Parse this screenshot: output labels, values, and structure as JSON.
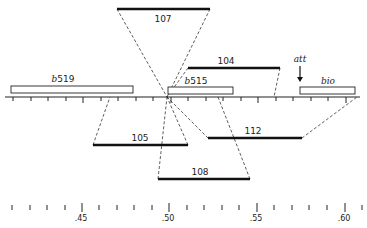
{
  "diagram": {
    "type": "genetic deletion/mapping diagram",
    "axis": {
      "y": 97,
      "x_start": 5,
      "x_end": 360,
      "tick_xs": [
        13,
        31,
        48,
        66,
        83,
        101,
        118,
        136,
        153,
        171,
        188,
        206,
        223,
        241,
        258,
        276,
        293,
        311,
        328,
        346
      ]
    },
    "pivot": {
      "x": 167,
      "y": 97
    },
    "segments": [
      {
        "id": "s107",
        "label": "107",
        "x1": 117,
        "x2": 210,
        "y": 9,
        "label_x": 163,
        "label_y": 22
      },
      {
        "id": "s104",
        "label": "104",
        "x1": 188,
        "x2": 280,
        "y": 68,
        "label_x": 226,
        "label_y": 64
      },
      {
        "id": "s105",
        "label": "105",
        "x1": 93,
        "x2": 188,
        "y": 145,
        "label_x": 140,
        "label_y": 141
      },
      {
        "id": "s112",
        "label": "112",
        "x1": 208,
        "x2": 302,
        "y": 138,
        "label_x": 253,
        "label_y": 134
      },
      {
        "id": "s108",
        "label": "108",
        "x1": 158,
        "x2": 250,
        "y": 179,
        "label_x": 200,
        "label_y": 175
      }
    ],
    "boxes": [
      {
        "id": "b519",
        "prefix": "b",
        "label": "519",
        "x": 11,
        "y": 86,
        "w": 122,
        "h": 7,
        "label_x": 63,
        "label_y": 82
      },
      {
        "id": "b515",
        "prefix": "b",
        "label": "515",
        "x": 168,
        "y": 87,
        "w": 65,
        "h": 7,
        "label_x": 196,
        "label_y": 84
      },
      {
        "id": "bio",
        "prefix": "",
        "label": "bio",
        "x": 300,
        "y": 87,
        "w": 55,
        "h": 7,
        "label_x": 328,
        "label_y": 84
      }
    ],
    "att": {
      "label": "att",
      "x": 300,
      "label_y": 62,
      "arrow_y1": 66,
      "arrow_y2": 82
    },
    "scale": {
      "y": 207,
      "tick_xs": [
        12,
        30,
        47,
        65,
        82,
        99,
        117,
        134,
        152,
        169,
        187,
        204,
        222,
        239,
        257,
        274,
        292,
        309,
        327,
        345,
        362
      ],
      "major": [
        {
          "x": 82,
          "label": ".45"
        },
        {
          "x": 169,
          "label": ".50"
        },
        {
          "x": 257,
          "label": ".55"
        },
        {
          "x": 345,
          "label": ".60"
        }
      ]
    }
  }
}
